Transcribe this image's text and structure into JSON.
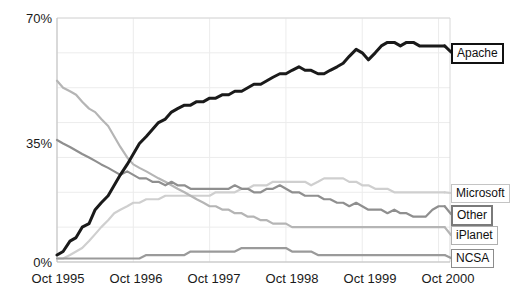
{
  "chart_data": {
    "type": "line",
    "title": "",
    "subtitle": "",
    "xlabel": "",
    "ylabel": "",
    "grid": true,
    "legend_position": "right-inline-labels",
    "ylim": [
      0,
      70
    ],
    "yticks": [
      "0%",
      "35%",
      "70%"
    ],
    "ytick_values": [
      0,
      35,
      70
    ],
    "xticks": [
      "Oct 1995",
      "Oct 1996",
      "Oct 1997",
      "Oct 1998",
      "Oct 1999",
      "Oct 2000"
    ],
    "xtick_values": [
      1995.75,
      1996.75,
      1997.75,
      1998.75,
      1999.75,
      2000.75
    ],
    "xlim": [
      1995.75,
      2000.9
    ],
    "x": [
      1995.75,
      1995.83,
      1995.92,
      1996.0,
      1996.08,
      1996.17,
      1996.25,
      1996.33,
      1996.42,
      1996.5,
      1996.58,
      1996.67,
      1996.75,
      1996.83,
      1996.92,
      1997.0,
      1997.08,
      1997.17,
      1997.25,
      1997.33,
      1997.42,
      1997.5,
      1997.58,
      1997.67,
      1997.75,
      1997.83,
      1997.92,
      1998.0,
      1998.08,
      1998.17,
      1998.25,
      1998.33,
      1998.42,
      1998.5,
      1998.58,
      1998.67,
      1998.75,
      1998.83,
      1998.92,
      1999.0,
      1999.08,
      1999.17,
      1999.25,
      1999.33,
      1999.42,
      1999.5,
      1999.58,
      1999.67,
      1999.75,
      1999.83,
      1999.92,
      2000.0,
      2000.08,
      2000.17,
      2000.25,
      2000.33,
      2000.42,
      2000.5,
      2000.58,
      2000.67,
      2000.75,
      2000.83
    ],
    "series": [
      {
        "name": "Apache",
        "color": "#1a1a1a",
        "label_border_color": "#111111",
        "values": [
          2,
          3,
          6,
          7,
          10,
          11,
          15,
          17,
          19,
          22,
          25,
          28,
          31,
          34,
          36,
          38,
          40,
          41,
          43,
          44,
          45,
          45,
          46,
          46,
          47,
          47,
          48,
          48,
          49,
          49,
          50,
          51,
          51,
          52,
          53,
          54,
          54,
          55,
          56,
          55,
          55,
          54,
          54,
          55,
          56,
          57,
          59,
          61,
          60,
          58,
          60,
          62,
          63,
          63,
          62,
          63,
          63,
          62,
          62,
          62,
          62,
          62
        ]
      },
      {
        "name": "Microsoft",
        "color": "#cfcfcf",
        "label_border_color": "#c4c4c4",
        "values": [
          1,
          1,
          2,
          3,
          4,
          6,
          8,
          10,
          12,
          14,
          15,
          16,
          17,
          17,
          18,
          18,
          18,
          19,
          19,
          19,
          19,
          19,
          19,
          19,
          19,
          20,
          20,
          20,
          20,
          21,
          21,
          22,
          22,
          22,
          23,
          23,
          23,
          23,
          23,
          23,
          22,
          23,
          24,
          24,
          24,
          24,
          23,
          23,
          22,
          22,
          21,
          21,
          21,
          20,
          20,
          20,
          20,
          20,
          20,
          20,
          20,
          20
        ]
      },
      {
        "name": "Other",
        "color": "#8f8f8f",
        "label_border_color": "#7a7a7a",
        "values": [
          35,
          34,
          33,
          32,
          31,
          30,
          29,
          28,
          27,
          26,
          25,
          26,
          25,
          24,
          24,
          23,
          23,
          22,
          23,
          22,
          22,
          21,
          21,
          21,
          21,
          21,
          21,
          21,
          22,
          21,
          21,
          20,
          20,
          21,
          21,
          22,
          21,
          20,
          20,
          19,
          19,
          19,
          18,
          18,
          17,
          17,
          16,
          17,
          16,
          15,
          15,
          15,
          14,
          15,
          14,
          14,
          13,
          13,
          13,
          15,
          16,
          16
        ]
      },
      {
        "name": "iPlanet",
        "color": "#b5b5b5",
        "label_border_color": "#b0b0b0",
        "values": [
          52,
          50,
          49,
          48,
          46,
          44,
          43,
          41,
          39,
          36,
          33,
          30,
          28,
          27,
          26,
          25,
          24,
          23,
          22,
          21,
          20,
          19,
          18,
          17,
          16,
          16,
          15,
          15,
          14,
          14,
          13,
          13,
          12,
          12,
          11,
          11,
          11,
          10,
          10,
          10,
          10,
          10,
          10,
          10,
          10,
          10,
          10,
          10,
          10,
          10,
          10,
          10,
          10,
          10,
          10,
          10,
          10,
          10,
          10,
          10,
          10,
          10
        ]
      },
      {
        "name": "NCSA",
        "color": "#9a9a9a",
        "label_border_color": "#8c8c8c",
        "values": [
          1,
          1,
          1,
          1,
          1,
          1,
          1,
          1,
          1,
          1,
          1,
          1,
          1,
          1,
          2,
          2,
          2,
          2,
          2,
          2,
          2,
          3,
          3,
          3,
          3,
          3,
          3,
          3,
          3,
          4,
          4,
          4,
          4,
          4,
          4,
          4,
          4,
          3,
          3,
          3,
          3,
          2,
          2,
          2,
          2,
          2,
          2,
          2,
          2,
          2,
          2,
          2,
          2,
          2,
          2,
          2,
          2,
          2,
          2,
          2,
          2,
          2
        ]
      }
    ],
    "gridline_color": "#ececec",
    "axis_color": "#d8d8d8"
  },
  "labels": {
    "apache": "Apache",
    "microsoft": "Microsoft",
    "other": "Other",
    "iplanet": "iPlanet",
    "ncsa": "NCSA"
  }
}
